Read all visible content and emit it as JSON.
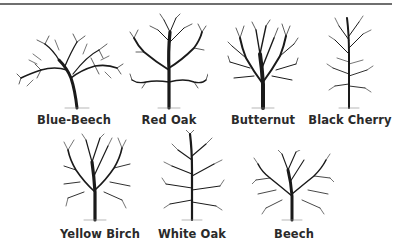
{
  "figure": {
    "title": "",
    "trees": [
      {
        "name": "Blue-Beech",
        "label_x": 74,
        "label_y": 113
      },
      {
        "name": "Red Oak",
        "label_x": 169,
        "label_y": 113
      },
      {
        "name": "Butternut",
        "label_x": 263,
        "label_y": 113
      },
      {
        "name": "Black Cherry",
        "label_x": 350,
        "label_y": 113
      },
      {
        "name": "Yellow Birch",
        "label_x": 100,
        "label_y": 227
      },
      {
        "name": "White Oak",
        "label_x": 192,
        "label_y": 227
      },
      {
        "name": "Beech",
        "label_x": 294,
        "label_y": 227
      }
    ]
  }
}
